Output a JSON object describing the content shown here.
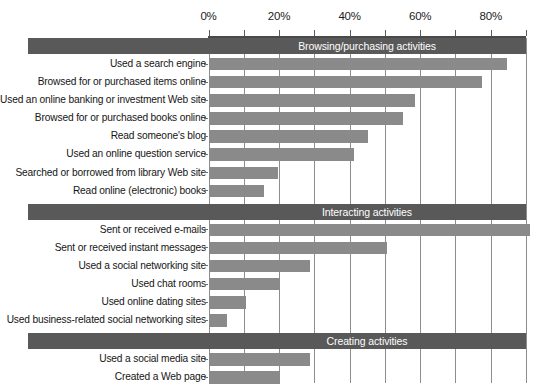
{
  "chart_data": {
    "type": "bar",
    "title": "",
    "subtitle": "",
    "xlabel": "",
    "ylabel": "",
    "orientation": "horizontal",
    "xlim": [
      0,
      90
    ],
    "xtick_values": [
      0,
      20,
      40,
      60,
      80
    ],
    "xtick_labels": [
      "0%",
      "20%",
      "40%",
      "60%",
      "80%"
    ],
    "gridlines_every": 10,
    "grid": true,
    "legend": "none",
    "units": "percent",
    "bar_color": "#8a8a8a",
    "group_header_color": "#595959",
    "groups": [
      {
        "label": "Browsing/purchasing activities",
        "categories": [
          "Used a search engine",
          "Browsed for or purchased items online",
          "Used an online banking or investment Web site",
          "Browsed for or purchased books online",
          "Read someone's blog",
          "Used an online question service",
          "Searched or borrowed from library Web site",
          "Read online (electronic) books"
        ],
        "values": [
          84.5,
          77.5,
          58.5,
          55,
          45,
          41,
          19.5,
          15.5
        ]
      },
      {
        "label": "Interacting activities",
        "categories": [
          "Sent or received e-mails",
          "Sent or received instant messages",
          "Used a social networking site",
          "Used chat rooms",
          "Used online dating sites",
          "Used business-related social networking sites"
        ],
        "values": [
          91,
          50.5,
          28.5,
          20,
          10.5,
          5
        ]
      },
      {
        "label": "Creating activities",
        "categories": [
          "Used a social media site",
          "Created a Web page"
        ],
        "values": [
          28.5,
          20
        ]
      }
    ]
  }
}
